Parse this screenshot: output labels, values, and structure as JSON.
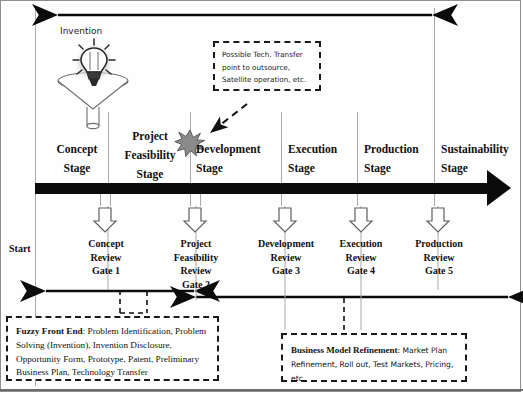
{
  "diagram": {
    "start_label": "Start",
    "invention_label": "Invention",
    "icons": {
      "funnel": "funnel-icon",
      "lightbulb": "lightbulb-icon",
      "starburst": "starburst-icon"
    },
    "colors": {
      "timeline": "#0b0b0b",
      "rail": "#a8a8a8",
      "starburst": "#8a8a8a",
      "dash_border": "#1a1a1a",
      "frame": "#8f8f8f"
    }
  },
  "stages": [
    {
      "name": "Concept",
      "suffix": "Stage"
    },
    {
      "name": "Project\nFeasibility",
      "line1": "Project",
      "line2": "Feasibility",
      "suffix": "Stage"
    },
    {
      "name": "Development",
      "suffix": "Stage"
    },
    {
      "name": "Execution",
      "suffix": "Stage"
    },
    {
      "name": "Production",
      "suffix": "Stage"
    },
    {
      "name": "Sustainability",
      "suffix": "Stage"
    }
  ],
  "gates": [
    {
      "line1": "Concept",
      "line2": "Review",
      "line3": "Gate 1",
      "line4": ""
    },
    {
      "line1": "Project",
      "line2": "Feasibility",
      "line3": "Review",
      "line4": "Gate 2"
    },
    {
      "line1": "Development",
      "line2": "Review",
      "line3": "Gate 3",
      "line4": ""
    },
    {
      "line1": "Execution",
      "line2": "Review",
      "line3": "Gate 4",
      "line4": ""
    },
    {
      "line1": "Production",
      "line2": "Review",
      "line3": "Gate 5",
      "line4": ""
    }
  ],
  "callout": {
    "line1": "Possible Tech. Transfer",
    "line2": "point to outsource,",
    "line3": "Satellite operation, etc."
  },
  "phase_boxes": {
    "fuzzy_front_end": {
      "heading": "Fuzzy Front End",
      "separator": ": ",
      "body": "Problem Identification, Problem Solving (Invention), Invention Disclosure, Opportunity Form, Prototype, Patent, Preliminary Business Plan, Technology Transfer"
    },
    "business_model_refinement": {
      "heading": "Business Model Refinement",
      "separator": ": ",
      "body": "Market Plan Refinement, Roll out, Test Markets, Pricing, etc."
    }
  }
}
